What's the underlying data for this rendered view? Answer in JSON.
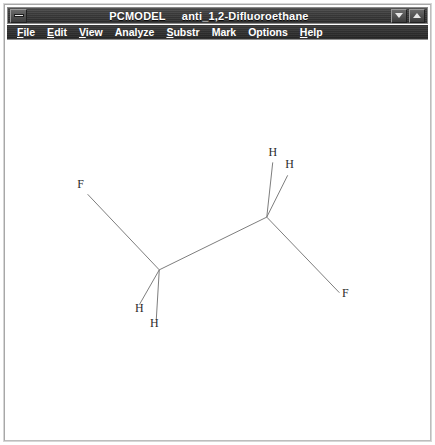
{
  "window": {
    "title": "PCMODEL     anti_1,2-Difluoroethane",
    "app_name": "PCMODEL",
    "document_name": "anti_1,2-Difluoroethane",
    "system_menu_icon": "system-menu-icon",
    "minimize_icon": "triangle-down-icon",
    "maximize_icon": "triangle-up-icon",
    "title_bar_color": "#3a3a3a",
    "title_text_color": "#ffffff"
  },
  "menu": {
    "items": [
      {
        "label": "File",
        "accel": "F"
      },
      {
        "label": "Edit",
        "accel": "E"
      },
      {
        "label": "View",
        "accel": "V"
      },
      {
        "label": "Analyze",
        "accel": ""
      },
      {
        "label": "Substr",
        "accel": "S"
      },
      {
        "label": "Mark",
        "accel": ""
      },
      {
        "label": "Options",
        "accel": ""
      },
      {
        "label": "Help",
        "accel": "H"
      }
    ]
  },
  "canvas": {
    "background_color": "#ffffff",
    "bond_color": "#6e6e6e",
    "label_color": "#2a2a2a",
    "molecule_name": "anti_1,2-Difluoroethane",
    "atoms": [
      {
        "id": "C1",
        "element": "C",
        "label": "",
        "x": 153,
        "y": 231
      },
      {
        "id": "C2",
        "element": "C",
        "label": "",
        "x": 261,
        "y": 178
      },
      {
        "id": "F1",
        "element": "F",
        "label": "F",
        "x": 74,
        "y": 149
      },
      {
        "id": "F2",
        "element": "F",
        "label": "F",
        "x": 340,
        "y": 258
      },
      {
        "id": "H1",
        "element": "H",
        "label": "H",
        "x": 267,
        "y": 117
      },
      {
        "id": "H2",
        "element": "H",
        "label": "H",
        "x": 284,
        "y": 129
      },
      {
        "id": "H3",
        "element": "H",
        "label": "H",
        "x": 133,
        "y": 273
      },
      {
        "id": "H4",
        "element": "H",
        "label": "H",
        "x": 148,
        "y": 288
      }
    ],
    "bonds": [
      {
        "from": "C1",
        "to": "C2",
        "x1": 153,
        "y1": 231,
        "x2": 261,
        "y2": 178
      },
      {
        "from": "C1",
        "to": "F1",
        "x1": 153,
        "y1": 231,
        "x2": 81,
        "y2": 155
      },
      {
        "from": "C1",
        "to": "H3",
        "x1": 153,
        "y1": 231,
        "x2": 133,
        "y2": 266
      },
      {
        "from": "C1",
        "to": "H4",
        "x1": 153,
        "y1": 231,
        "x2": 150,
        "y2": 281
      },
      {
        "from": "C2",
        "to": "F2",
        "x1": 261,
        "y1": 178,
        "x2": 334,
        "y2": 254
      },
      {
        "from": "C2",
        "to": "H1",
        "x1": 261,
        "y1": 178,
        "x2": 267,
        "y2": 123
      },
      {
        "from": "C2",
        "to": "H2",
        "x1": 261,
        "y1": 178,
        "x2": 282,
        "y2": 136
      }
    ]
  }
}
